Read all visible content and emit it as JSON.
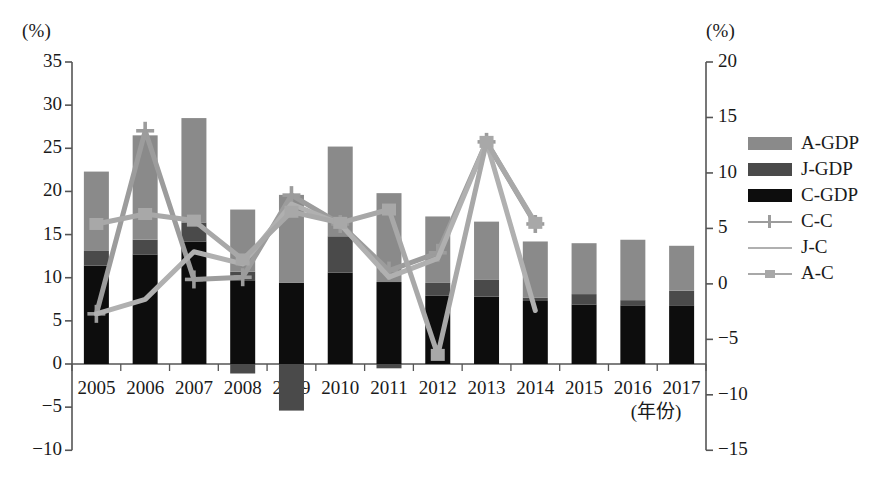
{
  "axes": {
    "left_unit": "(%)",
    "right_unit": "(%)",
    "x_unit": "(年份)",
    "left_ticks": [
      "35",
      "30",
      "25",
      "20",
      "15",
      "10",
      "5",
      "0",
      "−5",
      "−10"
    ],
    "right_ticks": [
      "20",
      "15",
      "10",
      "5",
      "0",
      "−5",
      "−10",
      "−15"
    ]
  },
  "legend": {
    "items": [
      {
        "label": "A-GDP",
        "kind": "bar",
        "color": "#8a8a8a",
        "marker": "none"
      },
      {
        "label": "J-GDP",
        "kind": "bar",
        "color": "#4a4a4a",
        "marker": "none"
      },
      {
        "label": "C-GDP",
        "kind": "bar",
        "color": "#0d0d0d",
        "marker": "none"
      },
      {
        "label": "C-C",
        "kind": "line",
        "color": "#9c9c9c",
        "marker": "cross"
      },
      {
        "label": "J-C",
        "kind": "line",
        "color": "#b0b0b0",
        "marker": "none"
      },
      {
        "label": "A-C",
        "kind": "line",
        "color": "#a8a8a8",
        "marker": "square"
      }
    ]
  },
  "chart_data": {
    "type": "bar",
    "title": "",
    "xlabel": "(年份)",
    "ylabel": "(%)",
    "ylim": [
      -10,
      35
    ],
    "y2lim": [
      -15,
      20
    ],
    "grid": false,
    "legend_position": "right",
    "categories": [
      "2005",
      "2006",
      "2007",
      "2008",
      "2009",
      "2010",
      "2011",
      "2012",
      "2013",
      "2014",
      "2015",
      "2016",
      "2017"
    ],
    "bar_series": [
      {
        "name": "C-GDP",
        "axis": "left",
        "color": "#0d0d0d",
        "values": [
          11.4,
          12.7,
          14.2,
          9.7,
          9.4,
          10.6,
          9.5,
          7.9,
          7.8,
          7.3,
          6.9,
          6.8,
          6.8
        ]
      },
      {
        "name": "J-GDP",
        "axis": "left",
        "color": "#4a4a4a",
        "values": [
          1.7,
          1.7,
          2.2,
          1.0,
          -1.1,
          4.2,
          -0.1,
          1.5,
          2.0,
          0.4,
          1.2,
          0.6,
          1.7
        ]
      },
      {
        "name": "A-GDP",
        "axis": "left",
        "color": "#8a8a8a",
        "values": [
          9.2,
          12.1,
          12.1,
          7.2,
          10.2,
          10.4,
          10.3,
          7.7,
          6.7,
          6.5,
          5.9,
          7.0,
          5.2
        ]
      }
    ],
    "bar_negative": [
      {
        "name": "J-GDP",
        "year": "2008",
        "value": -1.1,
        "color": "#4a4a4a"
      },
      {
        "name": "J-GDP",
        "year": "2009",
        "value": -5.4,
        "color": "#4a4a4a"
      },
      {
        "name": "J-GDP",
        "year": "2011",
        "value": -0.5,
        "color": "#4a4a4a"
      }
    ],
    "line_series": [
      {
        "name": "C-C",
        "axis": "right",
        "color": "#9c9c9c",
        "marker": "cross",
        "x": [
          "2005",
          "2006",
          "2007",
          "2008",
          "2009",
          "2010",
          "2011",
          "2012",
          "2013",
          "2014"
        ],
        "values": [
          -2.7,
          13.8,
          0.4,
          0.6,
          8.0,
          5.4,
          1.2,
          2.8,
          12.8,
          5.4
        ]
      },
      {
        "name": "J-C",
        "axis": "right",
        "color": "#b0b0b0",
        "marker": "none",
        "x": [
          "2005",
          "2006",
          "2007",
          "2008",
          "2009",
          "2010",
          "2011",
          "2012",
          "2013",
          "2014"
        ],
        "values": [
          -2.7,
          -1.4,
          2.9,
          1.8,
          7.2,
          5.4,
          0.6,
          2.3,
          12.8,
          -2.4
        ]
      },
      {
        "name": "A-C",
        "axis": "right",
        "color": "#a8a8a8",
        "marker": "square",
        "x": [
          "2005",
          "2006",
          "2007",
          "2008",
          "2009",
          "2010",
          "2011",
          "2012",
          "2013",
          "2014"
        ],
        "values": [
          5.4,
          6.3,
          5.7,
          2.2,
          6.5,
          5.5,
          6.7,
          -6.4,
          12.8,
          5.5
        ]
      }
    ]
  }
}
